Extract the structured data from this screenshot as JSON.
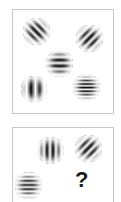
{
  "figure": {
    "kind": "gabor-patch-matrix-puzzle",
    "background_color": "#ffffff",
    "panel_border_color": "#c9c9c9",
    "panel_fill_color": "#ffffff",
    "grating_dark_color": "#000000",
    "grating_light_color": "#ffffff",
    "question_mark_color": "#1a1a1a"
  },
  "panels": [
    {
      "id": "panel-top",
      "name": "top-stimulus-panel",
      "truncated": false,
      "items": [
        {
          "id": "patch-top-left",
          "name": "gabor-patch-diagonal-right",
          "type": "gabor",
          "orientation_deg": 45,
          "orientation_label": "diagonal-slash",
          "spatial_frequency": "medium",
          "cycles": 5,
          "contrast": 0.95,
          "size_px": 27,
          "x_px": 10,
          "y_px": 8
        },
        {
          "id": "patch-top-right",
          "name": "gabor-patch-diagonal-left",
          "type": "gabor",
          "orientation_deg": 135,
          "orientation_label": "diagonal-backslash",
          "spatial_frequency": "medium",
          "cycles": 5,
          "contrast": 0.95,
          "size_px": 27,
          "x_px": 63,
          "y_px": 15
        },
        {
          "id": "patch-center",
          "name": "gabor-patch-horizontal-medium",
          "type": "gabor",
          "orientation_deg": 0,
          "orientation_label": "horizontal",
          "spatial_frequency": "medium",
          "cycles": 5,
          "contrast": 0.95,
          "size_px": 27,
          "x_px": 33,
          "y_px": 40
        },
        {
          "id": "patch-bottom-left",
          "name": "gabor-patch-vertical-low",
          "type": "gabor",
          "orientation_deg": 90,
          "orientation_label": "vertical",
          "spatial_frequency": "low",
          "cycles": 3,
          "contrast": 0.95,
          "size_px": 26,
          "x_px": 8,
          "y_px": 66
        },
        {
          "id": "patch-bottom-right",
          "name": "gabor-patch-horizontal-high",
          "type": "gabor",
          "orientation_deg": 0,
          "orientation_label": "horizontal",
          "spatial_frequency": "high",
          "cycles": 8,
          "contrast": 0.95,
          "size_px": 27,
          "x_px": 60,
          "y_px": 64
        }
      ]
    },
    {
      "id": "panel-bottom",
      "name": "bottom-query-panel",
      "truncated": true,
      "items": [
        {
          "id": "patch-q-top-left",
          "name": "gabor-patch-vertical-medium",
          "type": "gabor",
          "orientation_deg": 90,
          "orientation_label": "vertical",
          "spatial_frequency": "medium",
          "cycles": 5,
          "contrast": 0.95,
          "size_px": 27,
          "x_px": 24,
          "y_px": 9
        },
        {
          "id": "patch-q-top-right",
          "name": "gabor-patch-diagonal-left",
          "type": "gabor",
          "orientation_deg": 135,
          "orientation_label": "diagonal-backslash",
          "spatial_frequency": "medium",
          "cycles": 5,
          "contrast": 0.95,
          "size_px": 27,
          "x_px": 62,
          "y_px": 7
        },
        {
          "id": "patch-q-bottom-left",
          "name": "gabor-patch-horizontal-high",
          "type": "gabor",
          "orientation_deg": 0,
          "orientation_label": "horizontal",
          "spatial_frequency": "high",
          "cycles": 7,
          "contrast": 0.85,
          "size_px": 27,
          "x_px": 2,
          "y_px": 44
        },
        {
          "id": "missing-slot",
          "name": "missing-item-placeholder",
          "type": "text",
          "text": "?",
          "font_size_px": 22,
          "x_px": 62,
          "y_px": 41
        }
      ]
    }
  ]
}
